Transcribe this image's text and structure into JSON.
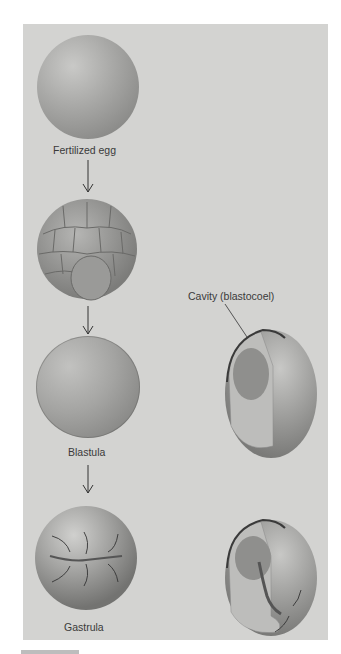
{
  "figure": {
    "stages": [
      {
        "id": "fertilized-egg",
        "label": "Fertilized egg"
      },
      {
        "id": "cleavage",
        "label": ""
      },
      {
        "id": "blastula",
        "label": "Blastula"
      },
      {
        "id": "gastrula",
        "label": "Gastrula"
      }
    ],
    "cutaway_labels": {
      "blastula_cavity": "Cavity (blastocoel)"
    },
    "colors": {
      "background": "#d3d3d1",
      "embryo": "#a8a8a6",
      "embryo_dark": "#6e6e6c",
      "text": "#3a3a3a"
    }
  }
}
